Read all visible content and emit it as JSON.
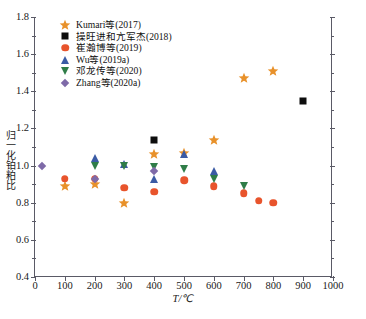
{
  "chart_data": {
    "type": "scatter",
    "title": "",
    "xlabel": "T/℃",
    "ylabel": "归一化铂粕比",
    "xlim": [
      0,
      1000
    ],
    "ylim": [
      0.4,
      1.8
    ],
    "xticks": [
      "0",
      "100",
      "200",
      "300",
      "400",
      "500",
      "600",
      "700",
      "800",
      "900",
      "1000"
    ],
    "yticks": [
      "0.4",
      "0.6",
      "0.8",
      "1.0",
      "1.2",
      "1.4",
      "1.6",
      "1.8"
    ],
    "grid": false,
    "legend_position": "top-left",
    "series": [
      {
        "name": "Kumari等(2017)",
        "marker": "star",
        "color": "#e8912a",
        "points": [
          {
            "x": 100,
            "y": 0.89
          },
          {
            "x": 200,
            "y": 0.9
          },
          {
            "x": 300,
            "y": 0.8
          },
          {
            "x": 400,
            "y": 1.06
          },
          {
            "x": 500,
            "y": 1.07
          },
          {
            "x": 600,
            "y": 1.14
          },
          {
            "x": 700,
            "y": 1.47
          },
          {
            "x": 800,
            "y": 1.51
          }
        ]
      },
      {
        "name": "操旺进和亢军杰(2018)",
        "marker": "square",
        "color": "#0d0d0d",
        "points": [
          {
            "x": 400,
            "y": 1.14
          },
          {
            "x": 900,
            "y": 1.35
          }
        ]
      },
      {
        "name": "崔瀚博等(2019)",
        "marker": "circle",
        "color": "#e8542c",
        "points": [
          {
            "x": 100,
            "y": 0.93
          },
          {
            "x": 200,
            "y": 0.93
          },
          {
            "x": 300,
            "y": 0.88
          },
          {
            "x": 400,
            "y": 0.86
          },
          {
            "x": 500,
            "y": 0.92
          },
          {
            "x": 600,
            "y": 0.89
          },
          {
            "x": 700,
            "y": 0.85
          },
          {
            "x": 750,
            "y": 0.81
          },
          {
            "x": 800,
            "y": 0.8
          }
        ]
      },
      {
        "name": "Wu等(2019a)",
        "marker": "triangle-up",
        "color": "#3b5ba5",
        "points": [
          {
            "x": 200,
            "y": 1.04
          },
          {
            "x": 300,
            "y": 1.01
          },
          {
            "x": 400,
            "y": 0.93
          },
          {
            "x": 500,
            "y": 1.06
          },
          {
            "x": 600,
            "y": 0.97
          }
        ]
      },
      {
        "name": "邓龙传等(2020)",
        "marker": "triangle-down",
        "color": "#2f7d48",
        "points": [
          {
            "x": 200,
            "y": 1.0
          },
          {
            "x": 300,
            "y": 1.0
          },
          {
            "x": 400,
            "y": 0.99
          },
          {
            "x": 500,
            "y": 0.98
          },
          {
            "x": 600,
            "y": 0.93
          },
          {
            "x": 700,
            "y": 0.89
          }
        ]
      },
      {
        "name": "Zhang等(2020a)",
        "marker": "diamond",
        "color": "#7e6aa8",
        "points": [
          {
            "x": 25,
            "y": 1.0
          },
          {
            "x": 200,
            "y": 0.93
          },
          {
            "x": 400,
            "y": 0.97
          }
        ]
      }
    ]
  },
  "legend": {
    "items": [
      {
        "label": "Kumari等(2017)",
        "marker": "star-icon"
      },
      {
        "label": "操旺进和亢军杰(2018)",
        "marker": "square-icon"
      },
      {
        "label": "崔瀚博等(2019)",
        "marker": "circle-icon"
      },
      {
        "label": "Wu等(2019a)",
        "marker": "triangle-up-icon"
      },
      {
        "label": "邓龙传等(2020)",
        "marker": "triangle-down-icon"
      },
      {
        "label": "Zhang等(2020a)",
        "marker": "diamond-icon"
      }
    ]
  },
  "axes": {
    "x_title": "T/℃",
    "y_title": "归一化铂粕比",
    "x_tick_labels": [
      "0",
      "100",
      "200",
      "300",
      "400",
      "500",
      "600",
      "700",
      "800",
      "900",
      "1000"
    ],
    "y_tick_labels": [
      "0.4",
      "0.6",
      "0.8",
      "1.0",
      "1.2",
      "1.4",
      "1.6",
      "1.8"
    ]
  }
}
